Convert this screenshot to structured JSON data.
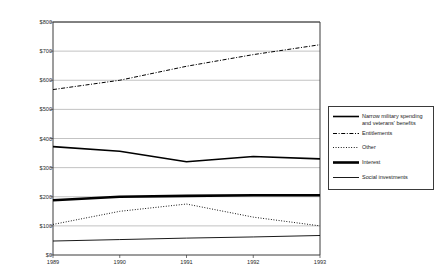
{
  "chart_data": {
    "type": "line",
    "title": "",
    "xlabel": "",
    "ylabel": "Constant 1992 dollars (in billions)",
    "x": [
      1989,
      1990,
      1991,
      1992,
      1993
    ],
    "xtick_labels": [
      "1989",
      "1990",
      "1991",
      "1992",
      "1993"
    ],
    "ytick_labels": [
      "$0",
      "$100",
      "$200",
      "$300",
      "$400",
      "$500",
      "$600",
      "$700",
      "$800"
    ],
    "ytick_values": [
      0,
      100,
      200,
      300,
      400,
      500,
      600,
      700,
      800
    ],
    "ylim": [
      0,
      800
    ],
    "xlim": [
      1989,
      1993
    ],
    "grid": "horizontal",
    "legend_position": "right",
    "series": [
      {
        "name": "Narrow military spending and veterans' benefits",
        "legend_label": "Narrow military spending\nand veterans' benefits",
        "style": "solid",
        "width": 1.6,
        "color": "#000000",
        "values": [
          372,
          356,
          320,
          338,
          330
        ]
      },
      {
        "name": "Entitlements",
        "legend_label": "Entitlements",
        "style": "dash-dot",
        "width": 1.0,
        "color": "#000000",
        "values": [
          568,
          600,
          648,
          688,
          722
        ]
      },
      {
        "name": "Other",
        "legend_label": "Other",
        "style": "dotted",
        "width": 1.0,
        "color": "#000000",
        "values": [
          105,
          150,
          175,
          130,
          100
        ]
      },
      {
        "name": "Interest",
        "legend_label": "Interest",
        "style": "solid",
        "width": 2.6,
        "color": "#000000",
        "values": [
          188,
          200,
          203,
          205,
          205
        ]
      },
      {
        "name": "Social investments",
        "legend_label": "Social investments",
        "style": "solid",
        "width": 0.9,
        "color": "#000000",
        "values": [
          48,
          53,
          58,
          62,
          67
        ]
      }
    ]
  },
  "colors": {
    "axis": "#3a3a3a",
    "grid": "#9a9a9a",
    "line": "#000000",
    "text": "#1a1a1a",
    "background": "#ffffff"
  }
}
